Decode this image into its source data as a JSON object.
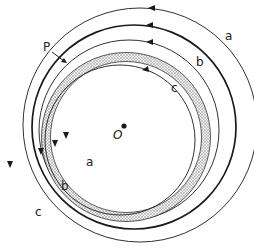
{
  "diagram": {
    "point_p_label": "P",
    "point_o_label": "O",
    "curve_labels": {
      "a_upper": "a",
      "b_upper": "b",
      "c_upper": "c",
      "a_lower": "a",
      "b_lower": "b",
      "c_lower": "c"
    },
    "colors": {
      "stroke": "#1a1a1a",
      "band_fill": "#c9c9c9",
      "background": "#ffffff"
    }
  }
}
